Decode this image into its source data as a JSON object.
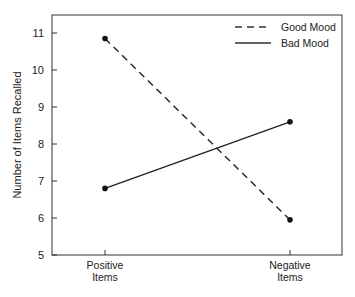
{
  "chart_data": {
    "type": "line",
    "title": "",
    "xlabel": "",
    "ylabel": "Number of Items Recalled",
    "categories": [
      "Positive Items",
      "Negative Items"
    ],
    "category_lines": [
      [
        "Positive",
        "Items"
      ],
      [
        "Negative",
        "Items"
      ]
    ],
    "ylim": [
      5,
      11.5
    ],
    "yticks": [
      5,
      6,
      7,
      8,
      9,
      10,
      11
    ],
    "grid": false,
    "legend_position": "upper right",
    "series": [
      {
        "name": "Good Mood",
        "style": "dashed",
        "values": [
          10.85,
          5.95
        ]
      },
      {
        "name": "Bad Mood",
        "style": "solid",
        "values": [
          6.8,
          8.6
        ]
      }
    ]
  },
  "legend": {
    "items": [
      "Good Mood",
      "Bad Mood"
    ]
  }
}
